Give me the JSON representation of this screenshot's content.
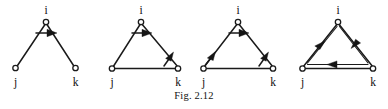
{
  "figure": {
    "caption": "Fig. 2.12",
    "vertex_labels": {
      "top": "i",
      "bottom_left": "j",
      "bottom_right": "k"
    },
    "ink_color": "#1a1a1a",
    "background_color": "#ffffff",
    "node_fill": "#ffffff"
  },
  "diagrams": [
    {
      "name": "two-path-undirected-with-single-arrow",
      "index": 1,
      "labels": {
        "top": "i",
        "bottom_left": "j",
        "bottom_right": "k"
      },
      "edges": [
        "i-j",
        "i-k"
      ],
      "arrows": [
        {
          "name": "top-horizontal-arrow",
          "direction": "right",
          "position": "below-apex"
        }
      ]
    },
    {
      "name": "triangle-two-arrows",
      "index": 2,
      "labels": {
        "top": "i",
        "bottom_left": "j",
        "bottom_right": "k"
      },
      "edges": [
        "i-j",
        "i-k",
        "j-k"
      ],
      "arrows": [
        {
          "name": "top-horizontal-arrow",
          "direction": "right",
          "position": "below-apex"
        },
        {
          "name": "right-edge-arrow",
          "direction": "up-right",
          "position": "near-k"
        }
      ]
    },
    {
      "name": "triangle-three-arrows",
      "index": 3,
      "labels": {
        "top": "i",
        "bottom_left": "j",
        "bottom_right": "k"
      },
      "edges": [
        "i-j",
        "i-k",
        "j-k"
      ],
      "arrows": [
        {
          "name": "top-horizontal-arrow",
          "direction": "right",
          "position": "below-apex"
        },
        {
          "name": "left-edge-arrow",
          "direction": "up-right",
          "position": "near-j"
        },
        {
          "name": "right-edge-arrow",
          "direction": "up-right",
          "position": "near-k"
        }
      ]
    },
    {
      "name": "triangle-with-inner-directed-cycle",
      "index": 4,
      "labels": {
        "top": "i",
        "bottom_left": "j",
        "bottom_right": "k"
      },
      "edges": [
        "i-j",
        "i-k",
        "j-k"
      ],
      "inner_cycle": [
        "j-to-i",
        "i-to-k",
        "k-to-j"
      ],
      "arrows": [
        {
          "name": "inner-left-arrow",
          "direction": "up-right",
          "position": "inner-left-edge"
        },
        {
          "name": "inner-right-arrow",
          "direction": "down-left",
          "position": "inner-right-edge"
        },
        {
          "name": "inner-bottom-arrow",
          "direction": "left",
          "position": "inner-bottom-edge"
        }
      ]
    }
  ]
}
